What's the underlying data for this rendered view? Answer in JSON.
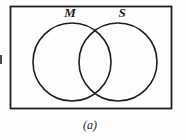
{
  "figure": {
    "caption": "(a)",
    "background": "#ffffff",
    "stroke_color": "#1f1f1f",
    "venn": {
      "type": "venn-2-set",
      "sets": [
        {
          "label": "M"
        },
        {
          "label": "S"
        }
      ]
    }
  }
}
